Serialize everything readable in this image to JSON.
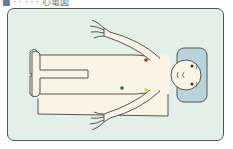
{
  "header": {
    "clipped_title": "■  ·  ·  ·  ·  ·  心電図"
  },
  "figure": {
    "colors": {
      "background": "#e3f0ea",
      "skin": "#fbf3e6",
      "outline": "#555555",
      "pillow": "#b9d3dc"
    },
    "electrodes": [
      {
        "name": "red-electrode",
        "color": "#a0392b",
        "x": 146,
        "y": 60
      },
      {
        "name": "green-electrode",
        "color": "#2e6b3e",
        "x": 122,
        "y": 88
      },
      {
        "name": "yellow-electrode",
        "color": "#e8c84a",
        "x": 146,
        "y": 90
      }
    ]
  }
}
